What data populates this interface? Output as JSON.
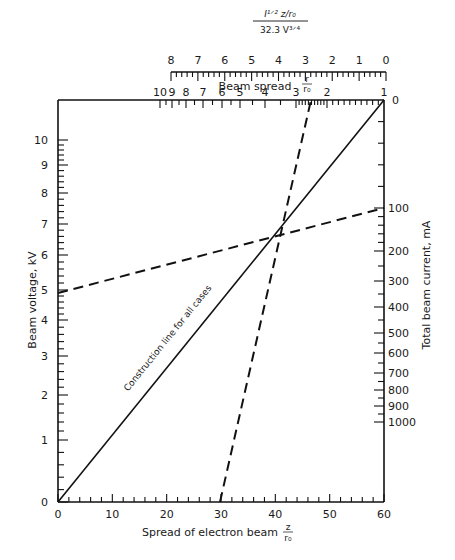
{
  "chart_data": {
    "type": "line",
    "subtype": "nomogram",
    "title": "",
    "axes": {
      "left": {
        "label": "Beam voltage, kV",
        "ticks": [
          "0",
          "1",
          "2",
          "3",
          "4",
          "5",
          "6",
          "7",
          "8",
          "9",
          "10"
        ]
      },
      "bottom": {
        "label": "Spread of electron beam z/r0",
        "label_main": "Spread of electron beam",
        "label_frac_num": "z",
        "label_frac_den": "r₀",
        "ticks": [
          "0",
          "10",
          "20",
          "30",
          "40",
          "50",
          "60"
        ],
        "range": [
          0,
          60
        ]
      },
      "right": {
        "label": "Total beam current, mA",
        "ticks": [
          "0",
          "100",
          "200",
          "300",
          "400",
          "500",
          "600",
          "700",
          "800",
          "900",
          "1000"
        ]
      },
      "top_inner": {
        "label": "Beam spread r/r0",
        "label_main": "Beam spread",
        "label_frac_num": "r",
        "label_frac_den": "r₀",
        "ticks": [
          "10",
          "9",
          "8",
          "7",
          "6",
          "5",
          "4",
          "3",
          "2",
          "1"
        ]
      },
      "top_outer": {
        "label": "I^(1/2) z/r0 / 32.3 V^(3/4)",
        "numerator": "I¹ᐟ² z/r₀",
        "denominator": "32.3 V³ᐟ⁴",
        "ticks": [
          "8",
          "7",
          "6",
          "5",
          "4",
          "3",
          "2",
          "1",
          "0"
        ],
        "range": [
          8,
          0
        ]
      }
    },
    "series": [
      {
        "name": "Construction line for all cases",
        "style": "solid",
        "from": {
          "x": 0,
          "voltage_kV": 0
        },
        "to": {
          "x": 60,
          "top": 0
        }
      },
      {
        "name": "Example: voltage to current",
        "style": "dashed",
        "from": {
          "voltage_kV": 4.8
        },
        "to": {
          "current_mA": 100
        },
        "through_intersection": true
      },
      {
        "name": "Example: spread to beam spread",
        "style": "dashed",
        "from": {
          "x": 30
        },
        "to": {
          "beam_spread_r_r0": 2.7
        },
        "through_intersection": true
      }
    ],
    "annotations": [
      "Construction line for all cases"
    ],
    "intersection": {
      "x": 41,
      "voltage_kV": 6.6
    }
  },
  "labels": {
    "left_axis": "Beam voltage, kV",
    "right_axis": "Total beam current, mA",
    "bottom_axis": "Spread of electron beam",
    "bottom_frac_num": "z",
    "bottom_frac_den": "r₀",
    "beam_spread": "Beam spread",
    "beam_spread_num": "r",
    "beam_spread_den": "r₀",
    "top_num": "I¹ᐟ² z/r₀",
    "top_den": "32.3 V³ᐟ⁴",
    "construction": "Construction line for all cases"
  }
}
